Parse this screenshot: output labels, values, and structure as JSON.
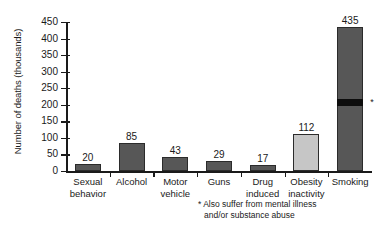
{
  "chart_data": {
    "type": "bar",
    "title": "",
    "subtitle": "",
    "xlabel": "",
    "ylabel": "Number of deaths (thousands)",
    "ylim": [
      0,
      450
    ],
    "yticks": [
      0,
      50,
      100,
      150,
      200,
      250,
      300,
      350,
      400,
      450
    ],
    "ytick_labels": [
      "0",
      "50",
      "100",
      "150",
      "200",
      "250",
      "300",
      "350",
      "400",
      "450"
    ],
    "grid": false,
    "legend": "none",
    "categories": [
      "Sexual behavior",
      "Alcohol",
      "Motor vehicle",
      "Guns",
      "Drug induced",
      "Obesity inactivity",
      "Smoking"
    ],
    "category_lines": [
      [
        "Sexual",
        "behavior"
      ],
      [
        "Alcohol",
        ""
      ],
      [
        "Motor",
        "vehicle"
      ],
      [
        "Guns",
        ""
      ],
      [
        "Drug",
        "induced"
      ],
      [
        "Obesity",
        "inactivity"
      ],
      [
        "Smoking",
        ""
      ]
    ],
    "values": [
      20,
      85,
      43,
      29,
      17,
      112,
      435
    ],
    "value_labels": [
      "20",
      "85",
      "43",
      "29",
      "17",
      "112",
      "435"
    ],
    "bar_colors": [
      "dark",
      "dark",
      "dark",
      "dark",
      "dark",
      "light",
      "dark"
    ],
    "annotations": [
      {
        "series_index": 6,
        "type": "band",
        "from": 192,
        "to": 214,
        "color": "#0d0d0d",
        "marker": "*"
      }
    ]
  },
  "colors": {
    "bar_dark": "#575757",
    "bar_light": "#c6c6c6",
    "band": "#0d0d0d",
    "axis": "#1a1a1a",
    "background": "#ffffff"
  },
  "footnote": {
    "line1": "* Also suffer from mental illness",
    "line2": "and/or substance abuse"
  }
}
